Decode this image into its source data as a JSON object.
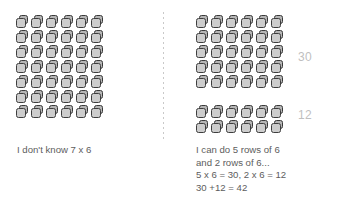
{
  "background_color": "#ffffff",
  "cube": {
    "face_color": "#cdcdcd",
    "body_color": "#b5b5b5",
    "outline_color": "#3d3d3d",
    "icon_name": "cube-icon"
  },
  "divider": {
    "style": "dotted-vertical",
    "color": "#c9c9c9"
  },
  "left_panel": {
    "grid": {
      "rows": 7,
      "columns": 6,
      "total": 42
    },
    "caption": "I don't know 7 x 6"
  },
  "right_panel": {
    "groups": [
      {
        "name": "top-group",
        "rows": 5,
        "columns": 6,
        "label": "30",
        "label_color": "#bfbfbf"
      },
      {
        "name": "bottom-group",
        "rows": 2,
        "columns": 6,
        "label": "12",
        "label_color": "#bfbfbf"
      }
    ],
    "caption_lines": [
      "I can do 5 rows of 6",
      "and 2 rows of 6...",
      "5 x 6 = 30, 2 x 6 = 12",
      "30 +12 = 42"
    ]
  },
  "text_color": "#5d5d5d"
}
